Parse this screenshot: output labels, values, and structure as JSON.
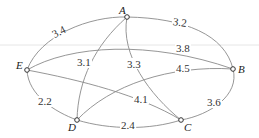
{
  "diagram": {
    "type": "weighted-graph",
    "nodes": [
      {
        "id": "A",
        "label": "A"
      },
      {
        "id": "B",
        "label": "B"
      },
      {
        "id": "C",
        "label": "C"
      },
      {
        "id": "D",
        "label": "D"
      },
      {
        "id": "E",
        "label": "E"
      }
    ],
    "edges": [
      {
        "from": "E",
        "to": "A",
        "weight": "3.4"
      },
      {
        "from": "A",
        "to": "B",
        "weight": "3.2"
      },
      {
        "from": "E",
        "to": "B",
        "weight": "3.8"
      },
      {
        "from": "A",
        "to": "D",
        "weight": "3.1"
      },
      {
        "from": "A",
        "to": "C",
        "weight": "3.3"
      },
      {
        "from": "D",
        "to": "B",
        "weight": "4.5"
      },
      {
        "from": "E",
        "to": "C",
        "weight": "4.1"
      },
      {
        "from": "E",
        "to": "D",
        "weight": "2.2"
      },
      {
        "from": "D",
        "to": "C",
        "weight": "2.4"
      },
      {
        "from": "B",
        "to": "C",
        "weight": "3.6"
      }
    ]
  }
}
